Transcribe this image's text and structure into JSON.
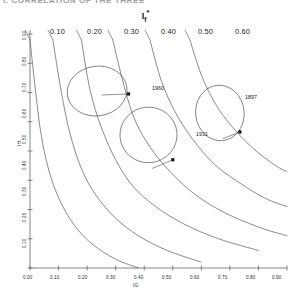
{
  "figure": {
    "clipped_header": "I. CORRELATION OF THE THREE",
    "top_axis_title": "I",
    "top_axis_title_sub": "f",
    "top_axis_title_sup": "*",
    "x_axis_name": "IG",
    "y_axis_name": "IH",
    "background": "#ffffff",
    "line_color": "#4a4a52",
    "axis_color": "#55555c",
    "marker_color": "#111111"
  },
  "chart_data": {
    "type": "line",
    "title": "If*",
    "xlabel": "IG",
    "ylabel": "IH",
    "xlim": [
      0.0,
      0.9
    ],
    "ylim": [
      0.1,
      0.9
    ],
    "grid": false,
    "legend": "none",
    "xticks": [
      "0.00",
      "0.10",
      "0.20",
      "0.30",
      "0.40",
      "0.50",
      "0.60",
      "0.70",
      "0.80",
      "0.90"
    ],
    "xtick_values": [
      0.0,
      0.1,
      0.2,
      0.3,
      0.4,
      0.5,
      0.6,
      0.7,
      0.8,
      0.9
    ],
    "yticks": [
      "0.90",
      "0.80",
      "0.70",
      "0.60",
      "0.50",
      "0.40",
      "0.30",
      "0.20",
      "0.10"
    ],
    "ytick_values": [
      0.9,
      0.8,
      0.7,
      0.6,
      0.5,
      0.4,
      0.3,
      0.2,
      0.1
    ],
    "contour_labels": [
      "0.10",
      "0.20",
      "0.30",
      "0.40",
      "0.50",
      "0.60"
    ],
    "contour_values": [
      0.1,
      0.2,
      0.3,
      0.4,
      0.5,
      0.6
    ],
    "series": [
      {
        "name": "0.10",
        "type": "contour",
        "points": [
          [
            0.0,
            0.88
          ],
          [
            0.02,
            0.7
          ],
          [
            0.04,
            0.55
          ],
          [
            0.07,
            0.42
          ],
          [
            0.11,
            0.32
          ],
          [
            0.16,
            0.24
          ],
          [
            0.22,
            0.18
          ],
          [
            0.3,
            0.13
          ],
          [
            0.38,
            0.1
          ]
        ]
      },
      {
        "name": "0.20",
        "type": "contour",
        "points": [
          [
            0.08,
            0.88
          ],
          [
            0.11,
            0.7
          ],
          [
            0.14,
            0.56
          ],
          [
            0.18,
            0.44
          ],
          [
            0.23,
            0.35
          ],
          [
            0.3,
            0.27
          ],
          [
            0.38,
            0.21
          ],
          [
            0.48,
            0.16
          ],
          [
            0.6,
            0.12
          ]
        ]
      },
      {
        "name": "0.30",
        "type": "contour",
        "points": [
          [
            0.18,
            0.88
          ],
          [
            0.21,
            0.71
          ],
          [
            0.25,
            0.58
          ],
          [
            0.3,
            0.47
          ],
          [
            0.36,
            0.38
          ],
          [
            0.44,
            0.31
          ],
          [
            0.54,
            0.25
          ],
          [
            0.66,
            0.2
          ],
          [
            0.8,
            0.16
          ]
        ]
      },
      {
        "name": "0.40",
        "type": "contour",
        "points": [
          [
            0.29,
            0.88
          ],
          [
            0.33,
            0.72
          ],
          [
            0.37,
            0.6
          ],
          [
            0.43,
            0.5
          ],
          [
            0.5,
            0.42
          ],
          [
            0.58,
            0.35
          ],
          [
            0.68,
            0.29
          ],
          [
            0.8,
            0.24
          ],
          [
            0.9,
            0.21
          ]
        ]
      },
      {
        "name": "0.50",
        "type": "contour",
        "points": [
          [
            0.42,
            0.88
          ],
          [
            0.46,
            0.74
          ],
          [
            0.51,
            0.63
          ],
          [
            0.57,
            0.54
          ],
          [
            0.64,
            0.46
          ],
          [
            0.72,
            0.4
          ],
          [
            0.82,
            0.34
          ],
          [
            0.9,
            0.31
          ]
        ]
      },
      {
        "name": "0.60",
        "type": "contour",
        "points": [
          [
            0.56,
            0.88
          ],
          [
            0.6,
            0.76
          ],
          [
            0.65,
            0.66
          ],
          [
            0.71,
            0.58
          ],
          [
            0.78,
            0.51
          ],
          [
            0.86,
            0.45
          ],
          [
            0.9,
            0.43
          ]
        ]
      }
    ],
    "regions": [
      {
        "label": "1960",
        "cx": 0.235,
        "cy": 0.705,
        "rx": 0.105,
        "ry": 0.085,
        "rotation": -8,
        "marker_x": 0.345,
        "marker_y": 0.695
      },
      {
        "label": "1931",
        "cx": 0.415,
        "cy": 0.555,
        "rx": 0.1,
        "ry": 0.095,
        "rotation": -5,
        "marker_x": 0.5,
        "marker_y": 0.47
      },
      {
        "label": "1897",
        "cx": 0.665,
        "cy": 0.63,
        "rx": 0.085,
        "ry": 0.095,
        "rotation": -6,
        "marker_x": 0.735,
        "marker_y": 0.565
      }
    ]
  }
}
